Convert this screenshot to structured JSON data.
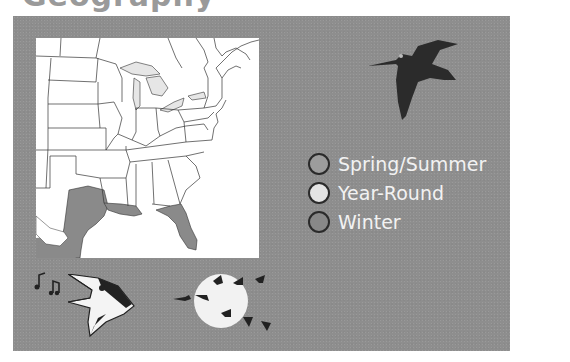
{
  "title": "Geography",
  "map": {
    "region": "Eastern United States",
    "shaded_areas": [
      "Texas Gulf coast",
      "Louisiana coast",
      "Florida peninsula",
      "Mexico Gulf coast"
    ],
    "shaded_area_color": "#8a8a8a",
    "land_color": "#ffffff",
    "lake_color": "#e6e6e6"
  },
  "legend": {
    "items": [
      {
        "label": "Spring/Summer",
        "color": "#9c9c9c"
      },
      {
        "label": "Year-Round",
        "color": "#e4e4e4"
      },
      {
        "label": "Winter",
        "color": "#888888"
      }
    ]
  },
  "icons": {
    "flying_bird": "flying-shorebird-silhouette",
    "singing_bird": "singing-bird-head",
    "music_notes": "music-notes",
    "migration": "geese-flying-across-moon"
  },
  "colors": {
    "panel_bg": "#8e8e8e",
    "text": "#f2f2f2"
  }
}
